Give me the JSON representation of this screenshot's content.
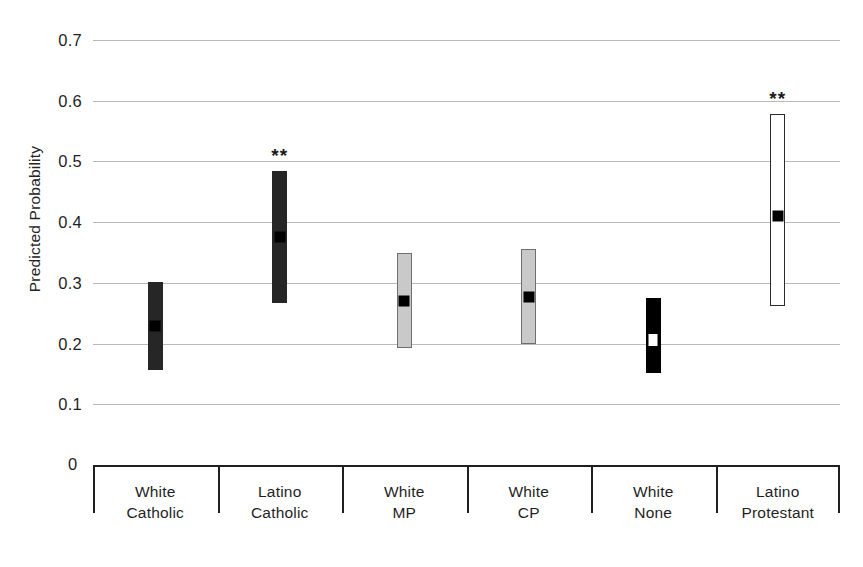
{
  "chart_data": {
    "type": "bar",
    "title": "",
    "xlabel": "",
    "ylabel": "Predicted Probability",
    "ylim": [
      0,
      0.7
    ],
    "grid": true,
    "legend": "none",
    "yticks": [
      0.7,
      0.6,
      0.5,
      0.4,
      0.3,
      0.2,
      0.1,
      0
    ],
    "ytick_labels": [
      "0.7",
      "0.6",
      "0.5",
      "0.4",
      "0.3",
      "0.2",
      "0.1",
      "0"
    ],
    "categories": [
      "White Catholic",
      "Latino Catholic",
      "White MP",
      "White CP",
      "White None",
      "Latino Protestant"
    ],
    "category_lines": [
      [
        "White",
        "Catholic"
      ],
      [
        "Latino",
        "Catholic"
      ],
      [
        "White",
        "MP"
      ],
      [
        "White",
        "CP"
      ],
      [
        "White",
        "None"
      ],
      [
        "Latino",
        "Protestant"
      ]
    ],
    "series": [
      {
        "name": "Predicted probability with confidence interval",
        "points": [
          {
            "category": "White Catholic",
            "value": 0.23,
            "ci_low": 0.157,
            "ci_high": 0.301,
            "style": "dark",
            "marker": "black",
            "significance": ""
          },
          {
            "category": "Latino Catholic",
            "value": 0.377,
            "ci_low": 0.267,
            "ci_high": 0.485,
            "style": "dark",
            "marker": "black",
            "significance": "**"
          },
          {
            "category": "White MP",
            "value": 0.272,
            "ci_low": 0.193,
            "ci_high": 0.349,
            "style": "gray",
            "marker": "black",
            "significance": ""
          },
          {
            "category": "White CP",
            "value": 0.278,
            "ci_low": 0.2,
            "ci_high": 0.355,
            "style": "gray",
            "marker": "black",
            "significance": ""
          },
          {
            "category": "White None",
            "value": 0.207,
            "ci_low": 0.152,
            "ci_high": 0.275,
            "style": "black",
            "marker": "white",
            "significance": ""
          },
          {
            "category": "Latino Protestant",
            "value": 0.412,
            "ci_low": 0.262,
            "ci_high": 0.578,
            "style": "white",
            "marker": "black",
            "significance": "**"
          }
        ]
      }
    ]
  }
}
